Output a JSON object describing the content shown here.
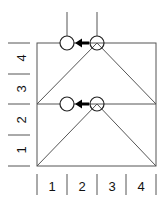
{
  "diagram": {
    "grid": {
      "cols": 4,
      "rows": 4
    },
    "left_axis": {
      "labels": [
        "4",
        "3",
        "2",
        "1"
      ]
    },
    "bottom_axis": {
      "labels": [
        "1",
        "2",
        "3",
        "4"
      ]
    },
    "layers": [
      {
        "name": "top",
        "arrow_direction": "left"
      },
      {
        "name": "bottom",
        "arrow_direction": "left"
      }
    ],
    "colors": {
      "line": "#555555",
      "arrow": "#000000",
      "text": "#111111"
    }
  }
}
